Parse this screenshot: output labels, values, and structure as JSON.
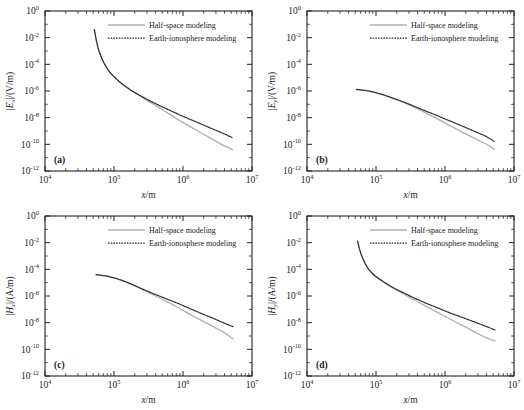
{
  "figure": {
    "panels": [
      {
        "id": "a",
        "panel_label": "(a)",
        "ylabel_pre": "|",
        "ylabel_sym": "E",
        "ylabel_sub": "x",
        "ylabel_post": "|/(V/m)",
        "xlabel_sym": "x",
        "xlabel_unit": "/m"
      },
      {
        "id": "b",
        "panel_label": "(b)",
        "ylabel_pre": "|",
        "ylabel_sym": "E",
        "ylabel_sub": "y",
        "ylabel_post": "|/(V/m)",
        "xlabel_sym": "x",
        "xlabel_unit": "/m"
      },
      {
        "id": "c",
        "panel_label": "(c)",
        "ylabel_pre": "|",
        "ylabel_sym": "H",
        "ylabel_sub": "x",
        "ylabel_post": "|/(A/m)",
        "xlabel_sym": "x",
        "xlabel_unit": "/m"
      },
      {
        "id": "d",
        "panel_label": "(d)",
        "ylabel_pre": "|",
        "ylabel_sym": "H",
        "ylabel_sub": "y",
        "ylabel_post": "|/(A/m)",
        "xlabel_sym": "x",
        "xlabel_unit": "/m"
      }
    ],
    "legend": {
      "entries": [
        {
          "label": "Half-space modeling",
          "style": "solid",
          "color": "#b0b0b0"
        },
        {
          "label": "Earth-ionosphere modeling",
          "style": "dotted",
          "color": "#303030"
        }
      ]
    },
    "xticklabels": [
      "10",
      "10",
      "10",
      "10"
    ],
    "xtickexps": [
      "4",
      "5",
      "6",
      "7"
    ],
    "yticklabels": [
      "10",
      "10",
      "10",
      "10",
      "10",
      "10",
      "10"
    ],
    "ytickexps": [
      "0",
      "-2",
      "-4",
      "-6",
      "-8",
      "-10",
      "-12"
    ]
  },
  "chart_data": [
    {
      "type": "line",
      "id": "a",
      "title": "(a)",
      "xlabel": "x/m",
      "ylabel": "|Ex|/(V/m)",
      "xscale": "log",
      "yscale": "log",
      "xlim": [
        10000,
        10000000
      ],
      "ylim": [
        1e-12,
        1
      ],
      "grid": false,
      "legend_position": "upper-right-inside",
      "series": [
        {
          "name": "Half-space modeling",
          "color": "#b0b0b0",
          "style": "solid",
          "x": [
            52000,
            55000,
            60000,
            70000,
            85000,
            100000,
            130000,
            170000,
            220000,
            300000,
            420000,
            600000,
            900000,
            1400000,
            2200000,
            3500000,
            5200000
          ],
          "y": [
            0.04,
            0.008,
            0.0012,
            0.00016,
            3e-05,
            1.2e-05,
            3.5e-06,
            1.3e-06,
            5.5e-07,
            2e-07,
            7e-08,
            2.2e-08,
            6e-09,
            1.6e-09,
            4.2e-10,
            1.1e-10,
            4e-11
          ]
        },
        {
          "name": "Earth-ionosphere modeling",
          "color": "#303030",
          "style": "dotted",
          "x": [
            52000,
            55000,
            60000,
            70000,
            85000,
            100000,
            130000,
            170000,
            220000,
            300000,
            420000,
            600000,
            900000,
            1400000,
            2200000,
            3500000,
            5200000
          ],
          "y": [
            0.04,
            0.008,
            0.0012,
            0.00016,
            3e-05,
            1.2e-05,
            3.5e-06,
            1.3e-06,
            5.8e-07,
            2.4e-07,
            1e-07,
            4.2e-08,
            1.6e-08,
            6e-09,
            2.2e-09,
            8e-10,
            3.2e-10
          ]
        }
      ]
    },
    {
      "type": "line",
      "id": "b",
      "title": "(b)",
      "xlabel": "x/m",
      "ylabel": "|Ey|/(V/m)",
      "xscale": "log",
      "yscale": "log",
      "xlim": [
        10000,
        10000000
      ],
      "ylim": [
        1e-12,
        1
      ],
      "grid": false,
      "legend_position": "upper-right-inside",
      "series": [
        {
          "name": "Half-space modeling",
          "color": "#b0b0b0",
          "style": "solid",
          "x": [
            52000,
            70000,
            95000,
            130000,
            180000,
            250000,
            350000,
            500000,
            750000,
            1100000,
            1700000,
            2600000,
            3900000,
            5200000
          ],
          "y": [
            1.3e-06,
            1.1e-06,
            8e-07,
            5e-07,
            2.7e-07,
            1.4e-07,
            6.5e-08,
            2.6e-08,
            9e-09,
            3e-09,
            9.5e-10,
            3e-10,
            1.1e-10,
            4.2e-11
          ]
        },
        {
          "name": "Earth-ionosphere modeling",
          "color": "#303030",
          "style": "dotted",
          "x": [
            52000,
            70000,
            95000,
            130000,
            180000,
            250000,
            350000,
            500000,
            750000,
            1100000,
            1700000,
            2600000,
            3900000,
            5200000
          ],
          "y": [
            1.3e-06,
            1.1e-06,
            8e-07,
            5e-07,
            2.8e-07,
            1.5e-07,
            7.5e-08,
            3.5e-08,
            1.5e-08,
            6.5e-09,
            2.6e-09,
            1e-09,
            4e-10,
            1.6e-10
          ]
        }
      ]
    },
    {
      "type": "line",
      "id": "c",
      "title": "(c)",
      "xlabel": "x/m",
      "ylabel": "|Hx|/(A/m)",
      "xscale": "log",
      "yscale": "log",
      "xlim": [
        10000,
        10000000
      ],
      "ylim": [
        1e-12,
        1
      ],
      "grid": false,
      "legend_position": "upper-right-inside",
      "series": [
        {
          "name": "Half-space modeling",
          "color": "#b0b0b0",
          "style": "solid",
          "x": [
            55000,
            75000,
            100000,
            140000,
            190000,
            260000,
            360000,
            520000,
            780000,
            1150000,
            1750000,
            2700000,
            4000000,
            5300000
          ],
          "y": [
            4e-05,
            3.2e-05,
            2.3e-05,
            1.3e-05,
            6.5e-06,
            3e-06,
            1.3e-06,
            5e-07,
            1.7e-07,
            5.5e-08,
            1.7e-08,
            5.2e-09,
            1.7e-09,
            6e-10
          ]
        },
        {
          "name": "Earth-ionosphere modeling",
          "color": "#303030",
          "style": "dotted",
          "x": [
            55000,
            75000,
            100000,
            140000,
            190000,
            260000,
            360000,
            520000,
            780000,
            1150000,
            1750000,
            2700000,
            4000000,
            5300000
          ],
          "y": [
            4e-05,
            3.2e-05,
            2.3e-05,
            1.3e-05,
            6.8e-06,
            3.3e-06,
            1.6e-06,
            7.5e-07,
            3.3e-07,
            1.4e-07,
            5.5e-08,
            2.2e-08,
            9e-09,
            5e-09
          ]
        }
      ]
    },
    {
      "type": "line",
      "id": "d",
      "title": "(d)",
      "xlabel": "x/m",
      "ylabel": "|Hy|/(A/m)",
      "xscale": "log",
      "yscale": "log",
      "xlim": [
        10000,
        10000000
      ],
      "ylim": [
        1e-12,
        1
      ],
      "grid": false,
      "legend_position": "upper-right-inside",
      "series": [
        {
          "name": "Half-space modeling",
          "color": "#b0b0b0",
          "style": "solid",
          "x": [
            54000,
            58000,
            64000,
            75000,
            90000,
            110000,
            145000,
            190000,
            260000,
            360000,
            520000,
            780000,
            1200000,
            1900000,
            3000000,
            4500000,
            5300000
          ],
          "y": [
            0.013,
            0.003,
            0.0007,
            0.00014,
            4.5e-05,
            2e-05,
            7.5e-06,
            3.2e-06,
            1.3e-06,
            5e-07,
            1.8e-07,
            6e-08,
            1.8e-08,
            5.2e-09,
            1.5e-09,
            5.5e-10,
            4.5e-10
          ]
        },
        {
          "name": "Earth-ionosphere modeling",
          "color": "#303030",
          "style": "dotted",
          "x": [
            54000,
            58000,
            64000,
            75000,
            90000,
            110000,
            145000,
            190000,
            260000,
            360000,
            520000,
            780000,
            1200000,
            1900000,
            3000000,
            4500000,
            5300000
          ],
          "y": [
            0.013,
            0.003,
            0.0007,
            0.00014,
            4.5e-05,
            2e-05,
            7.8e-06,
            3.5e-06,
            1.6e-06,
            7e-07,
            3e-07,
            1.3e-07,
            5.2e-08,
            2.2e-08,
            9e-09,
            4e-09,
            2.8e-09
          ]
        }
      ]
    }
  ]
}
